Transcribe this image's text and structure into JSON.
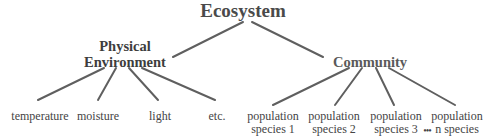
{
  "diagram": {
    "type": "tree",
    "root": {
      "label": "Ecosystem"
    },
    "branches": [
      {
        "label_lines": [
          "Physical",
          "Environment"
        ],
        "children": [
          "temperature",
          "moisture",
          "light",
          "etc."
        ]
      },
      {
        "label_lines": [
          "Community"
        ],
        "children": [
          [
            "population",
            "species 1"
          ],
          [
            "population",
            "species 2"
          ],
          [
            "population",
            "species 3"
          ],
          [
            "population",
            "n species"
          ]
        ],
        "ellipsis": "•••"
      }
    ],
    "line_color": "#5a5a5a",
    "text_color": "#444444"
  }
}
